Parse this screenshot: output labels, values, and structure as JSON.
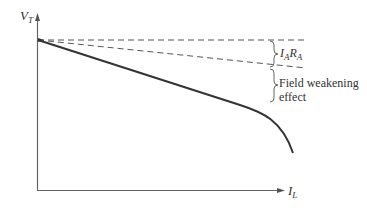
{
  "diagram": {
    "y_axis": {
      "label_main": "V",
      "label_sub": "T"
    },
    "x_axis": {
      "label_main": "I",
      "label_sub": "L"
    },
    "annotations": {
      "drop_1": {
        "main1": "I",
        "sub1": "A",
        "main2": "R",
        "sub2": "A"
      },
      "drop_2": {
        "line1": "Field weakening",
        "line2": "effect"
      }
    },
    "curves": [
      {
        "name": "no-load-reference",
        "style": "dashed",
        "description": "horizontal line at no-load voltage"
      },
      {
        "name": "armature-drop-line",
        "style": "dashed",
        "description": "linear drop due to IA RA"
      },
      {
        "name": "terminal-characteristic",
        "style": "solid",
        "description": "actual VT vs IL with field weakening"
      }
    ],
    "colors": {
      "line": "#333333",
      "axis": "#555555",
      "dashed": "#555555"
    }
  }
}
